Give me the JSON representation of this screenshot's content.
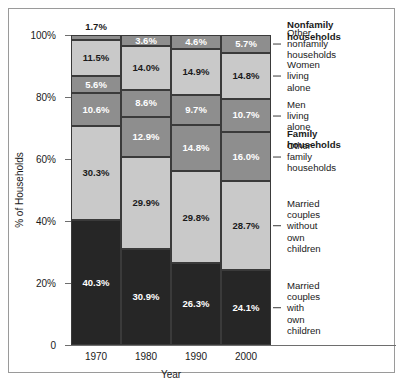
{
  "chart_data": {
    "type": "bar",
    "subtype": "stacked-bar-100",
    "title": "",
    "xlabel": "Year",
    "ylabel": "% of Households",
    "ylim": [
      0,
      100
    ],
    "ytick_labels": [
      "0",
      "20%",
      "40%",
      "60%",
      "80%",
      "100%"
    ],
    "ytick_values": [
      0,
      20,
      40,
      60,
      80,
      100
    ],
    "grid": false,
    "legend_position": "right-callouts",
    "categories": [
      "1970",
      "1980",
      "1990",
      "2000"
    ],
    "series": [
      {
        "name": "Married couples with own children",
        "shade": "dark",
        "values": [
          40.3,
          30.9,
          26.3,
          24.1
        ],
        "labels": [
          "40.3%",
          "30.9%",
          "26.3%",
          "24.1%"
        ]
      },
      {
        "name": "Married couples without own children",
        "shade": "light",
        "values": [
          30.3,
          29.9,
          29.8,
          28.7
        ],
        "labels": [
          "30.3%",
          "29.9%",
          "29.8%",
          "28.7%"
        ]
      },
      {
        "name": "Other family households",
        "shade": "mid",
        "values": [
          10.6,
          12.9,
          14.8,
          16.0
        ],
        "labels": [
          "10.6%",
          "12.9%",
          "14.8%",
          "16.0%"
        ]
      },
      {
        "name": "Men living alone",
        "shade": "mid",
        "values": [
          5.6,
          8.6,
          9.7,
          10.7
        ],
        "labels": [
          "5.6%",
          "8.6%",
          "9.7%",
          "10.7%"
        ]
      },
      {
        "name": "Women living alone",
        "shade": "light",
        "values": [
          11.5,
          14.0,
          14.9,
          14.8
        ],
        "labels": [
          "11.5%",
          "14.0%",
          "14.9%",
          "14.8%"
        ]
      },
      {
        "name": "Other nonfamily households",
        "shade": "mid",
        "values": [
          1.7,
          3.6,
          4.6,
          5.7
        ],
        "labels": [
          "1.7%",
          "3.6%",
          "4.6%",
          "5.7%"
        ]
      }
    ],
    "callouts": [
      {
        "text": "Nonfamily households",
        "kind": "group",
        "at_pct": 101.5
      },
      {
        "text": "Other nonfamily\nhouseholds",
        "kind": "series",
        "at_pct": 97.2
      },
      {
        "text": "Women living alone",
        "kind": "series",
        "at_pct": 86.8
      },
      {
        "text": "Men living alone",
        "kind": "series",
        "at_pct": 74.0
      },
      {
        "text": "Family households",
        "kind": "group",
        "at_pct": 66.5
      },
      {
        "text": "Other family\nhouseholds",
        "kind": "series",
        "at_pct": 60.7
      },
      {
        "text": "Married couples\nwithout own children",
        "kind": "series",
        "at_pct": 38.5
      },
      {
        "text": "Married couples\nwith own children",
        "kind": "series",
        "at_pct": 12.0
      }
    ],
    "colors": {
      "dark": "#262626",
      "mid": "#8e8e8e",
      "light": "#c9c9c9",
      "outline": "#3a3a3a",
      "axis": "#6e6e6e"
    }
  }
}
